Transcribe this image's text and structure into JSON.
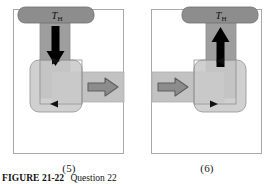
{
  "figure": {
    "caption_label": "FIGURE",
    "caption_number": "21-22",
    "caption_text": "Question 22"
  },
  "panels": [
    {
      "id": "panel-5",
      "caption": "(5)",
      "reservoir_label_main": "T",
      "reservoir_label_sub": "H",
      "vertical_arrow_direction": "down",
      "vertical_arrow_color": "#000000",
      "horizontal_arrow_direction": "right",
      "horizontal_arrow_side": "right",
      "horizontal_arrow_color": "#8c8c8c",
      "loop_marker_top_direction": "right",
      "loop_marker_bottom_direction": "left",
      "mirrored": false
    },
    {
      "id": "panel-6",
      "caption": "(6)",
      "reservoir_label_main": "T",
      "reservoir_label_sub": "H",
      "vertical_arrow_direction": "up",
      "vertical_arrow_color": "#000000",
      "horizontal_arrow_direction": "right",
      "horizontal_arrow_side": "left",
      "horizontal_arrow_color": "#8c8c8c",
      "loop_marker_top_direction": "left",
      "loop_marker_bottom_direction": "right",
      "mirrored": true
    }
  ],
  "colors": {
    "reservoir_fill": "#8d8d8d",
    "reservoir_stroke": "#6e6e6e",
    "band_fill": "#9e9e9e",
    "band_stroke": "#8a8a8a",
    "loop_fill": "#c9c9c9",
    "loop_stroke": "#9b9b9b",
    "work_band_fill": "#c2c2c2",
    "arrow_black": "#000000",
    "arrow_gray_fill": "#8c8c8c",
    "arrow_gray_stroke": "#5f5f5f",
    "frame_border": "#a9a9a9",
    "background": "#ffffff"
  }
}
